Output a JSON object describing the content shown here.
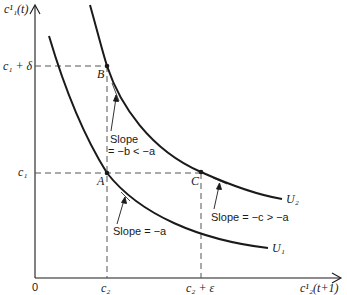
{
  "diagram": {
    "type": "indifference-curves",
    "axes": {
      "y_label": "c¹₁(t)",
      "x_label": "c¹₂(t+1)",
      "origin_label": "0"
    },
    "y_ticks": [
      {
        "id": "c1_plus_delta",
        "label": "c₁ + δ"
      },
      {
        "id": "c1",
        "label": "c₁"
      }
    ],
    "x_ticks": [
      {
        "id": "c2",
        "label": "c₂"
      },
      {
        "id": "c2_plus_eps",
        "label": "c₂ + ε"
      }
    ],
    "curves": [
      {
        "id": "U1",
        "label": "U₁"
      },
      {
        "id": "U2",
        "label": "U₂"
      }
    ],
    "points": [
      {
        "id": "A",
        "label": "A"
      },
      {
        "id": "B",
        "label": "B"
      },
      {
        "id": "C",
        "label": "C"
      }
    ],
    "annotations": {
      "slope_b": {
        "line1": "Slope",
        "line2": "= −b < −a"
      },
      "slope_a": "Slope = −a",
      "slope_c": "Slope = −c > −a"
    },
    "colors": {
      "ink": "#1a1a1a",
      "dash": "#555555",
      "background": "#ffffff"
    }
  }
}
